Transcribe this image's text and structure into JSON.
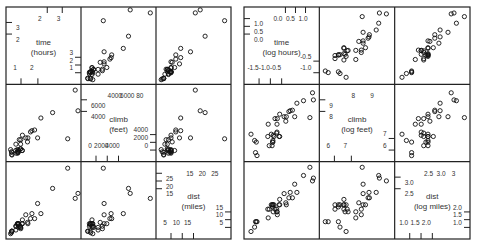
{
  "chart_data": [
    {
      "type": "scatter",
      "title": "",
      "matrix": "raw",
      "variables": [
        {
          "name": "time",
          "label_line1": "time",
          "label_line2": "(hours)",
          "range": [
            0.2,
            3.5
          ],
          "ticks_top": [
            2
          ],
          "ticks_bottom": [
            1,
            2
          ],
          "ticks_left": [
            2,
            3
          ],
          "ticks_right": [
            1,
            2,
            3
          ],
          "tick_labels_top": [
            "2",
            "3"
          ],
          "tick_labels_bottom": [
            "1",
            "2"
          ],
          "tick_labels_left": [
            "2",
            "3"
          ],
          "tick_labels_right": [
            "1",
            "2",
            "3"
          ]
        },
        {
          "name": "climb",
          "label_line1": "climb",
          "label_line2": "(feet)",
          "range": [
            0,
            7700
          ],
          "ticks": [
            0,
            2000,
            4000,
            6000,
            8000
          ],
          "tick_labels_top": [
            "4000",
            "6000",
            "80"
          ],
          "tick_labels_bottom": [
            "0",
            "2000",
            "4000"
          ],
          "tick_labels_left": [
            "4000",
            "6000"
          ],
          "tick_labels_right": [
            "0",
            "2000",
            "4000"
          ]
        },
        {
          "name": "dist",
          "label_line1": "dist",
          "label_line2": "(miles)",
          "range": [
            1.5,
            29
          ],
          "ticks": [
            5,
            10,
            15,
            20,
            25
          ],
          "tick_labels_top": [
            "15",
            "20",
            "25"
          ],
          "tick_labels_bottom": [
            "5",
            "10",
            "15"
          ],
          "tick_labels_left": [
            "15",
            "20",
            "25"
          ],
          "tick_labels_right": [
            "5",
            "10",
            "15"
          ]
        }
      ]
    },
    {
      "type": "scatter",
      "title": "",
      "matrix": "log",
      "variables": [
        {
          "name": "log_time",
          "label_line1": "time",
          "label_line2": "(log hours)",
          "range": [
            -1.6,
            1.35
          ],
          "tick_labels_top": [
            "0.0",
            "0.5",
            "1.0"
          ],
          "tick_labels_bottom": [
            "-1.5",
            "-1.0",
            "-0.5"
          ],
          "tick_labels_left": [
            "0.0",
            "0.5",
            "1.0"
          ],
          "tick_labels_right": [
            "-1.0",
            "-0.5"
          ]
        },
        {
          "name": "log_climb",
          "label_line1": "climb",
          "label_line2": "(log feet)",
          "range": [
            5.6,
            9.15
          ],
          "tick_labels_top": [
            "8",
            "9"
          ],
          "tick_labels_bottom": [
            "6",
            "7"
          ],
          "tick_labels_left": [
            "8",
            "9"
          ],
          "tick_labels_right": [
            "6",
            "7"
          ]
        },
        {
          "name": "log_dist",
          "label_line1": "dist",
          "label_line2": "(log miles)",
          "range": [
            0.55,
            3.4
          ],
          "tick_labels_top": [
            "2.5",
            "3.0",
            "3"
          ],
          "tick_labels_bottom": [
            "1.0",
            "1.5",
            "2.0"
          ],
          "tick_labels_left": [
            "2.5",
            "3.0"
          ],
          "tick_labels_right": [
            "1.0",
            "1.5",
            "2.0"
          ]
        }
      ]
    }
  ],
  "observations": {
    "dist": [
      2.4,
      6,
      6,
      7.5,
      8,
      8,
      16,
      6,
      5,
      6,
      28,
      5,
      9.5,
      6,
      4.5,
      10,
      14,
      3,
      4.5,
      5.5,
      3,
      3.5,
      6,
      2,
      3,
      4,
      6,
      5,
      6.5,
      5,
      10,
      6,
      18,
      4.5,
      20
    ],
    "climb": [
      650,
      2500,
      900,
      800,
      3070,
      2866,
      7500,
      800,
      800,
      650,
      2100,
      2000,
      2200,
      500,
      1500,
      3000,
      2200,
      350,
      1000,
      600,
      300,
      1500,
      2200,
      900,
      600,
      2000,
      800,
      950,
      1750,
      500,
      4400,
      600,
      5200,
      850,
      5000
    ],
    "time": [
      0.27,
      0.81,
      0.56,
      0.81,
      1.41,
      1.21,
      3.41,
      0.63,
      0.48,
      0.6,
      3.04,
      0.66,
      0.98,
      0.58,
      0.72,
      1.28,
      1.56,
      0.28,
      0.72,
      0.59,
      0.3,
      0.49,
      1.08,
      0.23,
      0.29,
      0.73,
      0.79,
      0.71,
      1.06,
      0.51,
      1.72,
      0.6,
      3.55,
      0.61,
      2.3
    ]
  },
  "layout": {
    "left_matrix": {
      "x": 6,
      "y": 7,
      "w": 225,
      "h": 232
    },
    "right_matrix": {
      "x": 244,
      "y": 7,
      "w": 226,
      "h": 232
    },
    "point_radius": 2.1
  }
}
